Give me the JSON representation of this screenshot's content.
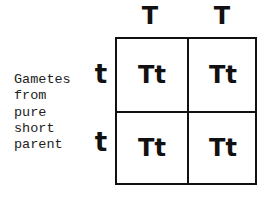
{
  "punnett_square": {
    "column_gametes": [
      "T",
      "T"
    ],
    "row_gametes": [
      "t",
      "t"
    ],
    "row_label_lines": [
      "Gametes",
      "from",
      "pure",
      "short",
      "parent"
    ],
    "cells": [
      [
        "Tt",
        "Tt"
      ],
      [
        "Tt",
        "Tt"
      ]
    ]
  }
}
